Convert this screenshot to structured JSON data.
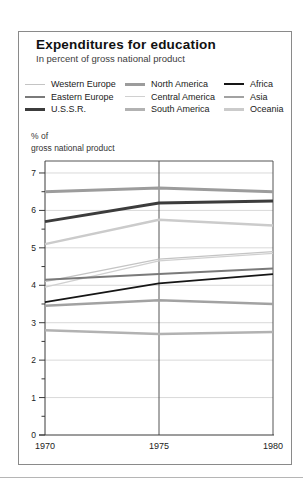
{
  "card": {
    "title": "Expenditures for education",
    "subtitle": "In percent of gross national product"
  },
  "axis_note": {
    "line1": "% of",
    "line2": "gross national product"
  },
  "chart_data": {
    "type": "line",
    "x": [
      1970,
      1975,
      1980
    ],
    "xtick_labels": [
      "1970",
      "1975",
      "1980"
    ],
    "ylabel": "% of gross national product",
    "ylim": [
      0,
      7.32
    ],
    "yticks": [
      0,
      1,
      2,
      3,
      4,
      5,
      6,
      7
    ],
    "minor_ytick_step": 0.5,
    "grid": true,
    "legend_position": "top",
    "series": [
      {
        "name": "Western Europe",
        "values": [
          4.1,
          4.7,
          4.9
        ],
        "color": "#c4c4c4",
        "width": 1.3
      },
      {
        "name": "Eastern Europe",
        "values": [
          4.15,
          4.3,
          4.45
        ],
        "color": "#7a7a7a",
        "width": 2
      },
      {
        "name": "U.S.S.R.",
        "values": [
          5.7,
          6.2,
          6.25
        ],
        "color": "#3c3c3c",
        "width": 3
      },
      {
        "name": "North America",
        "values": [
          6.5,
          6.6,
          6.5
        ],
        "color": "#9c9c9c",
        "width": 3
      },
      {
        "name": "Central America",
        "values": [
          3.95,
          4.65,
          4.85
        ],
        "color": "#d0d0d0",
        "width": 1.3
      },
      {
        "name": "South America",
        "values": [
          2.8,
          2.7,
          2.75
        ],
        "color": "#b2b2b2",
        "width": 2.5
      },
      {
        "name": "Africa",
        "values": [
          3.55,
          4.05,
          4.3
        ],
        "color": "#161616",
        "width": 1.7
      },
      {
        "name": "Asia",
        "values": [
          3.45,
          3.6,
          3.5
        ],
        "color": "#a2a2a2",
        "width": 2.5
      },
      {
        "name": "Oceania",
        "values": [
          5.1,
          5.75,
          5.6
        ],
        "color": "#cbcbcb",
        "width": 2.5
      }
    ],
    "legend_columns": [
      [
        "Western Europe",
        "Eastern Europe",
        "U.S.S.R."
      ],
      [
        "North America",
        "Central America",
        "South America"
      ],
      [
        "Africa",
        "Asia",
        "Oceania"
      ]
    ],
    "colors": {
      "gridline": "#d9d9d9",
      "axis": "#3a3a3a",
      "frame": "#555555",
      "tick_text": "#222222"
    }
  }
}
